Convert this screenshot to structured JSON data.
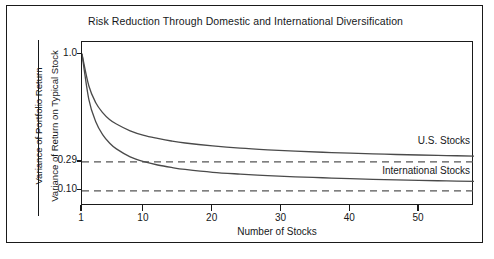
{
  "chart_data": {
    "type": "line",
    "title": "Risk Reduction Through Domestic and International Diversification",
    "xlabel": "Number of Stocks",
    "ylabel_numerator": "Variance of Portfolio Return",
    "ylabel_denominator": "Variance of Return on Typical Stock",
    "xlim": [
      1,
      58
    ],
    "ylim": [
      0.0,
      1.08
    ],
    "xticks": [
      1,
      10,
      20,
      30,
      40,
      50
    ],
    "xtick_labels": [
      "1",
      "10",
      "20",
      "30",
      "40",
      "50"
    ],
    "yticks": [
      1.0,
      0.29,
      0.1
    ],
    "ytick_labels": [
      "1.0",
      "0.29",
      "0.10"
    ],
    "grid": false,
    "legend_position": "inline-right-annotations",
    "reference_lines": [
      {
        "name": "us-asymptote",
        "value": 0.29,
        "style": "dashed",
        "color": "#555555"
      },
      {
        "name": "international-asymptote",
        "value": 0.1,
        "style": "dashed",
        "color": "#555555"
      }
    ],
    "series": [
      {
        "name": "U.S. Stocks",
        "color": "#4a4a4a",
        "asymptote": 0.29,
        "x": [
          1,
          2,
          3,
          4,
          5,
          6,
          8,
          10,
          12,
          14,
          16,
          20,
          24,
          28,
          32,
          36,
          40,
          45,
          50,
          54,
          58
        ],
        "values": [
          1.0,
          0.79,
          0.68,
          0.615,
          0.57,
          0.54,
          0.495,
          0.465,
          0.445,
          0.428,
          0.415,
          0.396,
          0.381,
          0.37,
          0.361,
          0.354,
          0.348,
          0.341,
          0.336,
          0.332,
          0.329
        ]
      },
      {
        "name": "International Stocks",
        "color": "#4a4a4a",
        "asymptote": 0.1,
        "x": [
          1,
          2,
          3,
          4,
          5,
          6,
          8,
          10,
          12,
          14,
          16,
          20,
          24,
          28,
          32,
          36,
          40,
          45,
          50,
          54,
          58
        ],
        "values": [
          1.0,
          0.7,
          0.555,
          0.47,
          0.415,
          0.376,
          0.324,
          0.292,
          0.27,
          0.254,
          0.241,
          0.222,
          0.21,
          0.2,
          0.192,
          0.186,
          0.18,
          0.174,
          0.169,
          0.165,
          0.162
        ]
      }
    ],
    "annotations": [
      {
        "name": "us-stocks-label",
        "text": "U.S. Stocks"
      },
      {
        "name": "international-stocks-label",
        "text": "International Stocks"
      }
    ]
  }
}
